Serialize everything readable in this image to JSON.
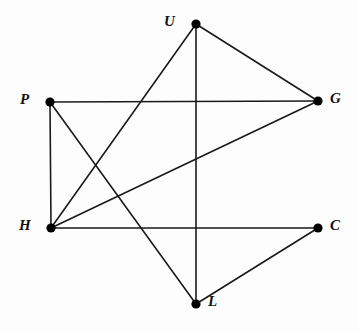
{
  "figure": {
    "kind": "undirected-graph-diagram",
    "background_color": "#fdfdfd",
    "stroke_color": "#1a1a1a",
    "vertex_fill_color": "#000000",
    "edge_width": 1.6,
    "vertex_radius": 4.6,
    "width": 358,
    "height": 331
  },
  "vertices": [
    {
      "id": "U",
      "label": "U",
      "x": 196,
      "y": 24,
      "label_x": 164,
      "label_y": 14,
      "label_side": "left"
    },
    {
      "id": "P",
      "label": "P",
      "x": 50,
      "y": 102,
      "label_x": 20,
      "label_y": 92,
      "label_side": "left"
    },
    {
      "id": "G",
      "label": "G",
      "x": 318,
      "y": 101,
      "label_x": 330,
      "label_y": 91,
      "label_side": "right"
    },
    {
      "id": "H",
      "label": "H",
      "x": 51,
      "y": 228,
      "label_x": 19,
      "label_y": 218,
      "label_side": "left"
    },
    {
      "id": "C",
      "label": "C",
      "x": 318,
      "y": 228,
      "label_x": 330,
      "label_y": 218,
      "label_side": "right"
    },
    {
      "id": "L",
      "label": "L",
      "x": 196,
      "y": 304,
      "label_x": 208,
      "label_y": 294,
      "label_side": "right"
    }
  ],
  "edges": [
    {
      "from": "P",
      "to": "G",
      "x1": 50,
      "y1": 102,
      "x2": 318,
      "y2": 101
    },
    {
      "from": "P",
      "to": "H",
      "x1": 50,
      "y1": 102,
      "x2": 51,
      "y2": 228
    },
    {
      "from": "P",
      "to": "L",
      "x1": 50,
      "y1": 102,
      "x2": 196,
      "y2": 304
    },
    {
      "from": "U",
      "to": "H",
      "x1": 196,
      "y1": 24,
      "x2": 51,
      "y2": 228
    },
    {
      "from": "U",
      "to": "G",
      "x1": 196,
      "y1": 24,
      "x2": 318,
      "y2": 101
    },
    {
      "from": "U",
      "to": "L",
      "x1": 196,
      "y1": 24,
      "x2": 196,
      "y2": 304
    },
    {
      "from": "H",
      "to": "G",
      "x1": 51,
      "y1": 228,
      "x2": 318,
      "y2": 101
    },
    {
      "from": "H",
      "to": "C",
      "x1": 51,
      "y1": 228,
      "x2": 318,
      "y2": 228
    },
    {
      "from": "L",
      "to": "C",
      "x1": 196,
      "y1": 304,
      "x2": 318,
      "y2": 228
    }
  ]
}
